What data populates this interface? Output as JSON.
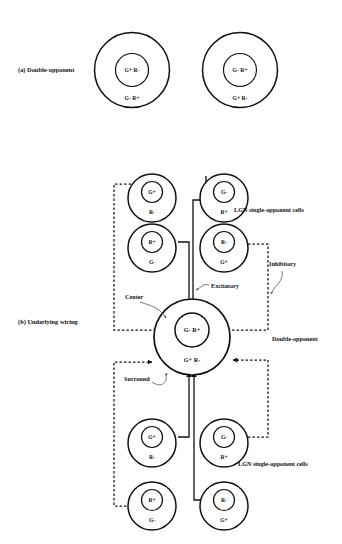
{
  "figure": {
    "panel_a": {
      "caption": "(a) Double-opponent",
      "cells": [
        {
          "name": "double-opponent-cell-left",
          "center_label": "G+ R-",
          "surround_label": "G- R+"
        },
        {
          "name": "double-opponent-cell-right",
          "center_label": "G- R+",
          "surround_label": "G+ R-"
        }
      ]
    },
    "panel_b": {
      "caption": "(b) Underlying wiring",
      "top_lgn_cells": [
        {
          "name": "lgn-top-left-1",
          "center_label": "G+",
          "surround_label": "R-"
        },
        {
          "name": "lgn-top-right-1",
          "center_label": "G-",
          "surround_label": "R+"
        },
        {
          "name": "lgn-top-left-2",
          "center_label": "R+",
          "surround_label": "G-"
        },
        {
          "name": "lgn-top-right-2",
          "center_label": "R-",
          "surround_label": "G+"
        }
      ],
      "bottom_lgn_cells": [
        {
          "name": "lgn-bottom-left-1",
          "center_label": "G+",
          "surround_label": "R-"
        },
        {
          "name": "lgn-bottom-right-1",
          "center_label": "G-",
          "surround_label": "R+"
        },
        {
          "name": "lgn-bottom-left-2",
          "center_label": "R+",
          "surround_label": "G-"
        },
        {
          "name": "lgn-bottom-right-2",
          "center_label": "R-",
          "surround_label": "G+"
        }
      ],
      "double_opponent": {
        "center_label": "G- R+",
        "surround_label": "G+ R-"
      },
      "annotations": {
        "lgn_top": "LGN single-opponent cells",
        "lgn_bottom": "LGN single-opponent cells",
        "inhibitory": "Inhibitory",
        "excitatory": "Excitatory",
        "center": "Center",
        "surround": "Surround",
        "double_opponent": "Double-opponent"
      }
    }
  },
  "colors": {
    "ink": "#111111",
    "leader": "#555555",
    "paper": "#ffffff"
  }
}
